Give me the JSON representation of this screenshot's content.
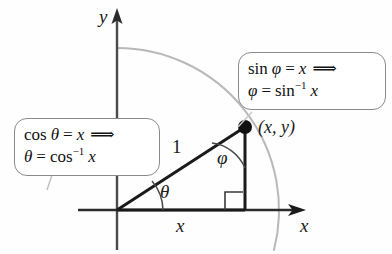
{
  "figure": {
    "type": "geometry-diagram",
    "background_color": "#fefefe",
    "axes": {
      "y_label": "y",
      "x_label": "x",
      "axis_color": "#3a3a3a"
    },
    "arc": {
      "name": "unit-circle-arc",
      "color": "#b4b4b4"
    },
    "triangle": {
      "hypotenuse_label": "1",
      "base_label": "x",
      "angle_at_origin": "θ",
      "angle_at_apex": "φ",
      "vertex_point_label": "(x, y)",
      "stroke_color": "#1a1a1a",
      "right_angle_marker": true
    },
    "callouts": [
      {
        "name": "cosine-callout",
        "line1": {
          "func": "cos",
          "angle": "θ",
          "equals": "=",
          "value": "x",
          "implies": "⟹"
        },
        "line2": {
          "angle": "θ",
          "equals": "=",
          "func": "cos",
          "exponent": "−1",
          "value": "x"
        }
      },
      {
        "name": "sine-callout",
        "line1": {
          "func": "sin",
          "angle": "φ",
          "equals": "=",
          "value": "x",
          "implies": "⟹"
        },
        "line2": {
          "angle": "φ",
          "equals": "=",
          "func": "sin",
          "exponent": "−1",
          "value": "x"
        }
      }
    ]
  }
}
